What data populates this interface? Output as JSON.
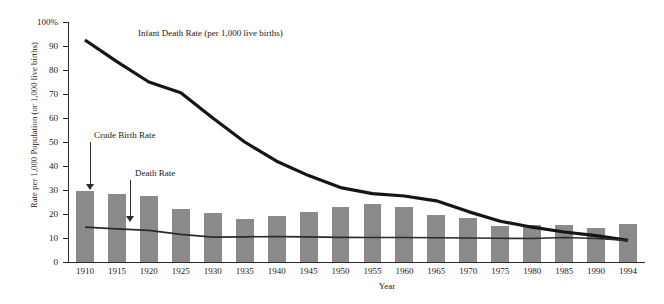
{
  "chart_data": {
    "type": "bar",
    "title": "",
    "xlabel": "Year",
    "ylabel": "Rate per 1,000 Population (or 1,000 live births)",
    "ylim": [
      0,
      100
    ],
    "ytick_labels": [
      "100%",
      "90",
      "80",
      "70",
      "60",
      "50",
      "40",
      "30",
      "20",
      "10",
      "0"
    ],
    "ytick_values": [
      100,
      90,
      80,
      70,
      60,
      50,
      40,
      30,
      20,
      10,
      0
    ],
    "grid": false,
    "legend_position": "inline-annotations",
    "categories": [
      "1910",
      "1915",
      "1920",
      "1925",
      "1930",
      "1935",
      "1940",
      "1945",
      "1950",
      "1955",
      "1960",
      "1965",
      "1970",
      "1975",
      "1980",
      "1985",
      "1990",
      "1994"
    ],
    "series": [
      {
        "name": "Crude Birth Rate",
        "render": "bar",
        "color": "#8a8a8a",
        "values": [
          29.5,
          28.5,
          27.5,
          22.0,
          20.5,
          18.0,
          19.0,
          21.0,
          23.0,
          24.0,
          23.0,
          19.5,
          18.5,
          15.0,
          15.5,
          15.5,
          14.0,
          16.0
        ]
      },
      {
        "name": "Death Rate",
        "render": "line",
        "color": "#2b2b2b",
        "values": [
          14.5,
          13.8,
          13.2,
          11.5,
          10.4,
          10.5,
          10.6,
          10.5,
          10.3,
          10.2,
          10.2,
          10.1,
          10.0,
          9.9,
          9.8,
          10.2,
          9.8,
          9.0
        ]
      },
      {
        "name": "Infant Death Rate (per 1,000 live births)",
        "render": "line-thick",
        "color": "#151515",
        "values": [
          92.5,
          83.5,
          75.0,
          70.5,
          60.0,
          50.0,
          42.0,
          36.0,
          31.0,
          28.5,
          27.5,
          25.5,
          21.0,
          17.0,
          14.5,
          12.5,
          11.0,
          9.0
        ]
      }
    ],
    "annotations": [
      {
        "name": "infant-death-rate",
        "text": "Infant Death Rate (per 1,000 live births)"
      },
      {
        "name": "crude-birth-rate",
        "text": "Crude Birth Rate"
      },
      {
        "name": "death-rate",
        "text": "Death Rate"
      }
    ]
  }
}
